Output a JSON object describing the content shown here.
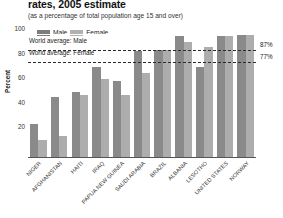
{
  "chart_data": {
    "type": "bar",
    "title": "rates, 2005 estimate",
    "subtitle": "(as a percentage of total population age 15 and over)",
    "ylabel": "Percent",
    "xlabel": "",
    "ylim": [
      0,
      100
    ],
    "yticks": [
      100,
      80,
      60,
      40,
      20
    ],
    "grid": true,
    "legend_position": "top-left",
    "categories": [
      "NIGER",
      "AFGHANISTAN",
      "HAITI",
      "IRAQ",
      "PAPUA NEW GUINEA",
      "SAUDI ARABIA",
      "BRAZIL",
      "ALBANIA",
      "LESOTHO",
      "UNITED STATES",
      "NORWAY"
    ],
    "series": [
      {
        "name": "Male",
        "color": "#8a8a8a",
        "values": [
          28,
          50,
          54,
          74,
          63,
          87,
          88,
          99,
          74,
          99,
          100
        ]
      },
      {
        "name": "Female",
        "color": "#adadad",
        "values": [
          15,
          18,
          51,
          64,
          51,
          69,
          88,
          94,
          90,
          99,
          100
        ]
      }
    ],
    "annotations": [
      {
        "label": "World average: Male",
        "value": 87,
        "value_label": "87%"
      },
      {
        "label": "World average: Female",
        "value": 77,
        "value_label": "77%"
      }
    ]
  }
}
